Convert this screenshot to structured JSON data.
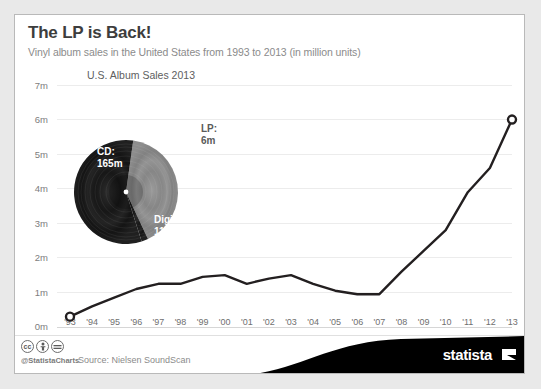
{
  "header": {
    "title": "The LP is Back!",
    "subtitle": "Vinyl album sales in the United States from 1993 to 2013 (in million units)"
  },
  "pie": {
    "title": "U.S. Album Sales 2013",
    "labels": {
      "cd": "CD:\n165m",
      "cd_name": "CD:",
      "cd_value": "165m",
      "digital_name": "Digital:",
      "digital_value": "118m",
      "lp_name": "LP:",
      "lp_value": "6m"
    }
  },
  "footer": {
    "cc": [
      "cc",
      "BY",
      "ND"
    ],
    "handle": "@StatistaCharts",
    "source": "Source: Nielsen SoundScan",
    "brand": "statista"
  },
  "chart_data": [
    {
      "type": "line",
      "title": "Vinyl album sales in the United States from 1993 to 2013 (in million units)",
      "xlabel": "",
      "ylabel": "",
      "ylim": [
        0,
        7
      ],
      "ytick_labels": [
        "0m",
        "1m",
        "2m",
        "3m",
        "4m",
        "5m",
        "6m",
        "7m"
      ],
      "ytick_values": [
        0,
        1,
        2,
        3,
        4,
        5,
        6,
        7
      ],
      "grid": true,
      "legend": "none",
      "categories": [
        "'93",
        "'94",
        "'95",
        "'96",
        "'97",
        "'98",
        "'99",
        "'00",
        "'01",
        "'02",
        "'03",
        "'04",
        "'05",
        "'06",
        "'07",
        "'08",
        "'09",
        "'10",
        "'11",
        "'12",
        "'13"
      ],
      "x_full": [
        1993,
        1994,
        1995,
        1996,
        1997,
        1998,
        1999,
        2000,
        2001,
        2002,
        2003,
        2004,
        2005,
        2006,
        2007,
        2008,
        2009,
        2010,
        2011,
        2012,
        2013
      ],
      "values": [
        0.3,
        0.6,
        0.85,
        1.1,
        1.25,
        1.25,
        1.45,
        1.5,
        1.25,
        1.4,
        1.5,
        1.25,
        1.05,
        0.95,
        0.95,
        1.6,
        2.2,
        2.8,
        3.9,
        4.6,
        6.0
      ],
      "unit": "million units",
      "markers": [
        {
          "category": "'93",
          "value": 0.3
        },
        {
          "category": "'13",
          "value": 6.0
        }
      ],
      "line_color": "#231f20"
    },
    {
      "type": "pie",
      "title": "U.S. Album Sales 2013",
      "labels": [
        "CD",
        "Digital",
        "LP"
      ],
      "values": [
        165,
        118,
        6
      ],
      "unit": "million units",
      "value_labels": [
        "165m",
        "118m",
        "6m"
      ],
      "colors": [
        "#1b1b1b",
        "#8d8d8d",
        "#2a2a2a"
      ],
      "style": "vinyl-record"
    }
  ]
}
